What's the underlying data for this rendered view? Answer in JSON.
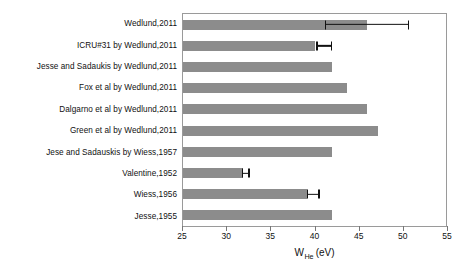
{
  "chart_data": {
    "type": "bar",
    "orientation": "horizontal",
    "title": "",
    "xlabel": "W_He (eV)",
    "xlabel_parts": {
      "main": "W",
      "sub": "He",
      "unit": "(eV)"
    },
    "ylabel": "",
    "xlim": [
      25,
      55
    ],
    "xticks": [
      25,
      30,
      35,
      40,
      45,
      50,
      55
    ],
    "xticklabels": [
      "25",
      "30",
      "35",
      "40",
      "45",
      "50",
      "55"
    ],
    "grid": false,
    "legend": null,
    "bar_color": "#8c8c8c",
    "error_color": "#111111",
    "frame_color": "#9a9a9a",
    "categories": [
      "Wedlund,2011",
      "ICRU#31 by Wedlund,2011",
      "Jesse and Sadaukis  by Wedlund,2011",
      "Fox et al by Wedlund,2011",
      "Dalgarno et al by Wedlund,2011",
      "Green et al by Wedlund,2011",
      "Jese and Sadauskis by Wiess,1957",
      "Valentine,1952",
      "Wiess,1956",
      "Jesse,1955"
    ],
    "values": [
      46.0,
      40.1,
      42.0,
      43.7,
      46.0,
      47.2,
      42.0,
      31.9,
      39.1,
      42.0
    ],
    "errors": [
      {
        "low": 41.2,
        "high": 50.8
      },
      {
        "low": 40.2,
        "high": 42.0
      },
      null,
      null,
      null,
      null,
      null,
      {
        "low": 31.7,
        "high": 32.6
      },
      {
        "low": 39.1,
        "high": 40.6
      },
      null
    ]
  }
}
